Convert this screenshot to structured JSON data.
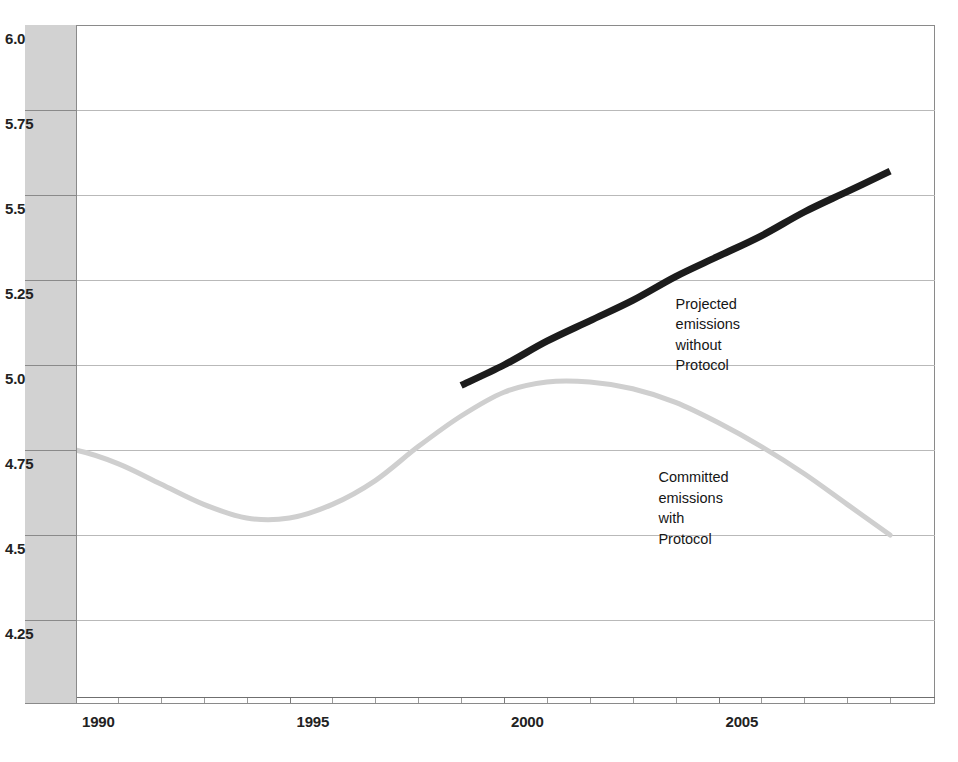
{
  "chart_data": {
    "type": "line",
    "title": "",
    "subtitle": "",
    "xlabel": "",
    "ylabel": "",
    "xlim": [
      1989,
      2009
    ],
    "ylim": [
      4.15,
      6.0
    ],
    "grid": true,
    "legend_position": "inline-annotations",
    "y_ticks": [
      "6.0",
      "5.75",
      "5.5",
      "5.25",
      "5.0",
      "4.75",
      "4.5",
      "4.25"
    ],
    "y_tick_values": [
      6.0,
      5.75,
      5.5,
      5.25,
      5.0,
      4.75,
      4.5,
      4.25
    ],
    "x_ticks": [
      "1990",
      "1995",
      "2000",
      "2005"
    ],
    "x_tick_values": [
      1990,
      1995,
      2000,
      2005
    ],
    "x_minor_tick_step": 1,
    "series": [
      {
        "name": "Committed emissions with Protocol",
        "color": "#cfcfcf",
        "width": 5,
        "x": [
          1989,
          1990,
          1991,
          1992,
          1993,
          1994,
          1995,
          1996,
          1997,
          1998,
          1999,
          2000,
          2001,
          2002,
          2003,
          2004,
          2005,
          2006,
          2007,
          2008,
          2009
        ],
        "values": [
          4.76,
          4.75,
          4.71,
          4.65,
          4.59,
          4.55,
          4.55,
          4.59,
          4.66,
          4.76,
          4.85,
          4.92,
          4.95,
          4.95,
          4.93,
          4.89,
          4.83,
          4.76,
          4.68,
          4.59,
          4.5
        ]
      },
      {
        "name": "Projected emissions without Protocol",
        "color": "#1c1c1c",
        "width": 7,
        "x": [
          1999,
          2000,
          2001,
          2002,
          2003,
          2004,
          2005,
          2006,
          2007,
          2008,
          2009
        ],
        "values": [
          4.94,
          5.0,
          5.07,
          5.13,
          5.19,
          5.26,
          5.32,
          5.38,
          5.45,
          5.51,
          5.57
        ]
      }
    ],
    "annotations": [
      {
        "id": "projected-annotation",
        "lines": [
          "Projected",
          "emissions",
          "without",
          "Protocol"
        ],
        "anchor_x": 2004.0,
        "anchor_y": 5.21
      },
      {
        "id": "committed-annotation",
        "lines": [
          "Committed",
          "emissions",
          "with",
          "Protocol"
        ],
        "anchor_x": 2003.6,
        "anchor_y": 4.7
      }
    ]
  },
  "colors": {
    "frame": "#8a8a8a",
    "gridline": "#b9b9b9",
    "ylabel_column_background": "#d2d2d2",
    "axis": "#6f6f6f",
    "projected_line": "#1c1c1c",
    "committed_line": "#cfcfcf",
    "text": "#161616",
    "background": "#ffffff"
  }
}
